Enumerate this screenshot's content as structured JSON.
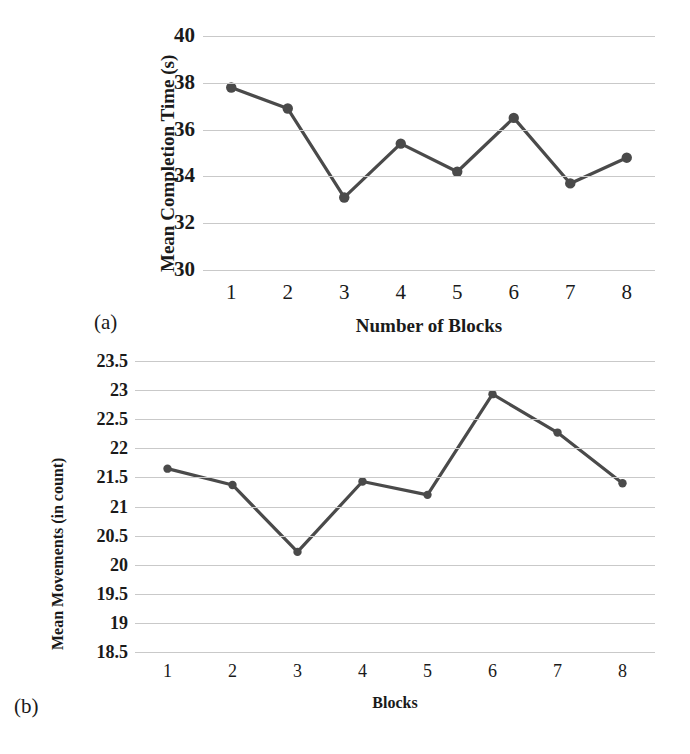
{
  "figure": {
    "background": "#ffffff",
    "line_color": "#4a4a4a",
    "grid_color": "#c9c9c9"
  },
  "chart_data": [
    {
      "type": "line",
      "panel": "a",
      "caption": "(a)",
      "title": "",
      "xlabel": "Number of Blocks",
      "ylabel": "Mean Completion Time (s)",
      "categories": [
        "1",
        "2",
        "3",
        "4",
        "5",
        "6",
        "7",
        "8"
      ],
      "x": [
        1,
        2,
        3,
        4,
        5,
        6,
        7,
        8
      ],
      "values": [
        37.8,
        36.9,
        33.1,
        35.4,
        34.2,
        36.5,
        33.7,
        34.8
      ],
      "yticks": [
        40,
        38,
        36,
        34,
        32,
        30
      ],
      "ytick_labels": [
        "40",
        "38",
        "36",
        "34",
        "32",
        "30"
      ],
      "ylim": [
        29.0,
        40.0
      ],
      "grid": true,
      "legend": "none",
      "series": [
        {
          "name": "Mean Completion Time (s)",
          "values": [
            37.8,
            36.9,
            33.1,
            35.4,
            34.2,
            36.5,
            33.7,
            34.8
          ]
        }
      ]
    },
    {
      "type": "line",
      "panel": "b",
      "caption": "(b)",
      "title": "",
      "xlabel": "Blocks",
      "ylabel": "Mean Movements (in count)",
      "categories": [
        "1",
        "2",
        "3",
        "4",
        "5",
        "6",
        "7",
        "8"
      ],
      "x": [
        1,
        2,
        3,
        4,
        5,
        6,
        7,
        8
      ],
      "values": [
        21.65,
        21.37,
        20.22,
        21.43,
        21.2,
        22.93,
        22.27,
        21.4
      ],
      "yticks": [
        23.5,
        23,
        22.5,
        22,
        21.5,
        21,
        20.5,
        20,
        19.5,
        19,
        18.5
      ],
      "ytick_labels": [
        "23.5",
        "23",
        "22.5",
        "22",
        "21.5",
        "21",
        "20.5",
        "20",
        "19.5",
        "19",
        "18.5"
      ],
      "ylim": [
        18.5,
        23.5
      ],
      "grid": true,
      "legend": "none",
      "series": [
        {
          "name": "Mean Movements (in count)",
          "values": [
            21.65,
            21.37,
            20.22,
            21.43,
            21.2,
            22.93,
            22.27,
            21.4
          ]
        }
      ]
    }
  ]
}
